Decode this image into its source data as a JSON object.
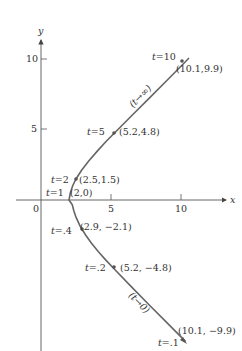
{
  "chart_data": {
    "type": "line",
    "title": "",
    "xlabel": "x",
    "ylabel": "y",
    "xlim": [
      -3,
      14
    ],
    "ylim": [
      -11,
      13
    ],
    "grid": false,
    "x_ticks": [
      {
        "value": 0,
        "label": "0"
      },
      {
        "value": 5,
        "label": "5"
      },
      {
        "value": 10,
        "label": "10"
      }
    ],
    "y_ticks": [
      {
        "value": 5,
        "label": "5"
      },
      {
        "value": 10,
        "label": "10"
      }
    ],
    "series": [
      {
        "name": "parametric curve x = t + 1/t, y = t - 1/t",
        "color": "#555555",
        "points": [
          {
            "t": "10",
            "x": 10.1,
            "y": 9.9,
            "t_label": "t=10",
            "coord_label": "(10.1,9.9)"
          },
          {
            "t": "5",
            "x": 5.2,
            "y": 4.8,
            "t_label": "t=5",
            "coord_label": "(5.2,4.8)"
          },
          {
            "t": "2",
            "x": 2.5,
            "y": 1.5,
            "t_label": "t=2",
            "coord_label": "(2.5,1.5)"
          },
          {
            "t": "1",
            "x": 2.0,
            "y": 0.0,
            "t_label": "t=1",
            "coord_label": "(2,0)"
          },
          {
            "t": ".4",
            "x": 2.9,
            "y": -2.1,
            "t_label": "t=.4",
            "coord_label": "(2.9, −2.1)"
          },
          {
            "t": ".2",
            "x": 5.2,
            "y": -4.8,
            "t_label": "t=.2",
            "coord_label": "(5.2,−4.8)"
          },
          {
            "t": ".1",
            "x": 10.1,
            "y": -9.9,
            "t_label": "t=.1",
            "coord_label": "(10.1,−9.9)"
          }
        ]
      }
    ],
    "annotations": [
      {
        "text": "(t→∞)",
        "near": "upper branch",
        "rotated": true
      },
      {
        "text": "(t→0)",
        "near": "lower branch",
        "rotated": true
      }
    ]
  },
  "axes": {
    "x_label": "x",
    "y_label": "y",
    "origin_label": "0",
    "x_tick_5": "5",
    "x_tick_10": "10",
    "y_tick_5": "5",
    "y_tick_10": "10"
  },
  "labels": {
    "t10": "t=10",
    "c10": "(10.1,9.9)",
    "t5": "t=5",
    "c5": "(5.2,4.8)",
    "t2": "t=2",
    "c2": "(2.5,1.5)",
    "t1": "t=1",
    "c1": "(2,0)",
    "t04": "t=.4",
    "c04": "(2.9, −2.1)",
    "t02": "t=.2",
    "c02": "(5.2, −4.8)",
    "t01": "t=.1",
    "c01": "(10.1, −9.9)",
    "upper_annot": "(t→∞)",
    "lower_annot": "(t→0)"
  }
}
